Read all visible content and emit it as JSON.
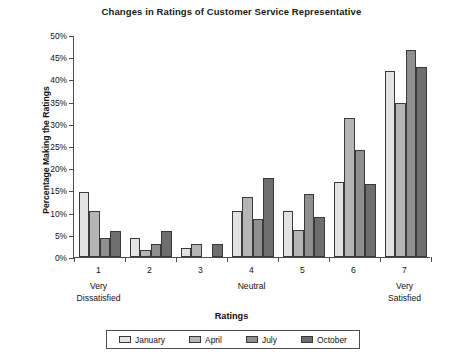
{
  "chart_data": {
    "type": "bar",
    "title": "Changes in Ratings of Customer Service Representative",
    "xlabel": "Ratings",
    "ylabel": "Percentage Making the Ratings",
    "categories": [
      "1",
      "2",
      "3",
      "4",
      "5",
      "6",
      "7"
    ],
    "category_sublabels": [
      "Very\nDissatisfied",
      "",
      "",
      "Neutral",
      "",
      "",
      "Very\nSatisfied"
    ],
    "ylim": [
      0,
      50
    ],
    "ytick_values": [
      0,
      5,
      10,
      15,
      20,
      25,
      30,
      35,
      40,
      45,
      50
    ],
    "ytick_labels": [
      "0%",
      "5%",
      "10%",
      "15%",
      "20%",
      "25%",
      "30%",
      "35%",
      "40%",
      "45%",
      "50%"
    ],
    "grid": false,
    "legend_position": "bottom",
    "series": [
      {
        "name": "January",
        "color": "#e3e3e3",
        "values": [
          14.6,
          4.2,
          2.1,
          10.4,
          10.4,
          16.8,
          41.8
        ]
      },
      {
        "name": "April",
        "color": "#b5b5b5",
        "values": [
          10.4,
          1.6,
          3.0,
          13.6,
          6.0,
          31.4,
          34.6
        ]
      },
      {
        "name": "July",
        "color": "#8f8f8f",
        "values": [
          4.3,
          2.9,
          0.0,
          8.5,
          14.3,
          24.0,
          46.7
        ]
      },
      {
        "name": "October",
        "color": "#6e6e6e",
        "values": [
          5.9,
          5.9,
          3.0,
          17.8,
          8.9,
          16.4,
          42.9
        ]
      }
    ]
  },
  "axis": {
    "x_sub_1_line1": "Very",
    "x_sub_1_line2": "Dissatisfied",
    "x_sub_4_line1": "Neutral",
    "x_sub_7_line1": "Very",
    "x_sub_7_line2": "Satisfied"
  }
}
